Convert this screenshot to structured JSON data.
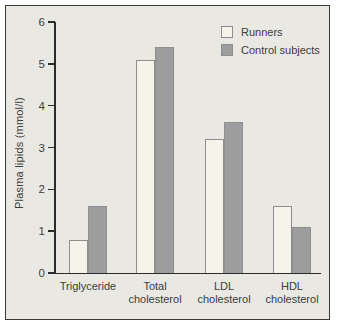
{
  "chart_data": {
    "type": "bar",
    "title": "",
    "ylabel": "Plasma lipids (mmol/l)",
    "xlabel": "",
    "units": "mmol/l",
    "ylim": [
      0,
      6
    ],
    "yticks": [
      0,
      1,
      2,
      3,
      4,
      5,
      6
    ],
    "grid": false,
    "legend_position": "top-right",
    "categories": [
      "Triglyceride",
      "Total cholesterol",
      "LDL cholesterol",
      "HDL cholesterol"
    ],
    "category_label_lines": [
      [
        "Triglyceride"
      ],
      [
        "Total",
        "cholesterol"
      ],
      [
        "LDL",
        "cholesterol"
      ],
      [
        "HDL",
        "cholesterol"
      ]
    ],
    "series": [
      {
        "name": "Runners",
        "values": [
          0.8,
          5.1,
          3.2,
          1.6
        ],
        "fill": "#f6f3ea",
        "border": "#8e8e8e"
      },
      {
        "name": "Control subjects",
        "values": [
          1.6,
          5.4,
          3.6,
          1.1
        ],
        "fill": "#9d9d9d",
        "border": "#8e8e8e"
      }
    ]
  },
  "colors": {
    "page_background": "#ffffff",
    "panel_background": "#e9e8e3",
    "panel_border": "#3a3a3a",
    "axis": "#2b2b2b",
    "text": "#3d3d3d"
  }
}
